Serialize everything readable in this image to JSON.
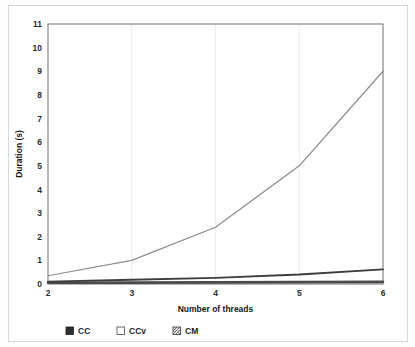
{
  "chart_data": {
    "type": "line",
    "title": "",
    "xlabel": "Number of threads",
    "ylabel": "Duration (s)",
    "x": [
      2,
      3,
      4,
      5,
      6
    ],
    "xtick_labels": [
      "2",
      "3",
      "4",
      "5",
      "6"
    ],
    "ytick_labels": [
      "0",
      "1",
      "2",
      "3",
      "4",
      "5",
      "6",
      "7",
      "8",
      "9",
      "10",
      "11"
    ],
    "xlim": [
      2,
      6
    ],
    "ylim": [
      0,
      11
    ],
    "grid": "vertical-light",
    "legend_position": "bottom-left",
    "series": [
      {
        "name": "CC",
        "marker": "filled-square",
        "marker_color": "#2e2e2e",
        "line_color": "#4a4a4a",
        "values": [
          0.05,
          0.06,
          0.07,
          0.08,
          0.09
        ]
      },
      {
        "name": "CCv",
        "marker": "empty-square",
        "marker_color": "#ffffff",
        "line_color": "#8a8a8a",
        "values": [
          0.35,
          1.0,
          2.4,
          5.0,
          9.0
        ]
      },
      {
        "name": "CM",
        "marker": "hatched-square",
        "marker_color": "#9a9a9a",
        "line_color": "#3d3d3d",
        "values": [
          0.1,
          0.18,
          0.26,
          0.4,
          0.62
        ]
      }
    ]
  },
  "axes": {
    "y_title": "Duration (s)",
    "x_title": "Number of threads",
    "y_ticks": [
      "11",
      "10",
      "9",
      "8",
      "7",
      "6",
      "5",
      "4",
      "3",
      "2",
      "1",
      "0"
    ],
    "x_ticks": [
      "2",
      "3",
      "4",
      "5",
      "6"
    ]
  },
  "legend": {
    "items": [
      {
        "label": "CC",
        "swatch": "filled-square-icon"
      },
      {
        "label": "CCv",
        "swatch": "empty-square-icon"
      },
      {
        "label": "CM",
        "swatch": "hatched-square-icon"
      }
    ]
  }
}
